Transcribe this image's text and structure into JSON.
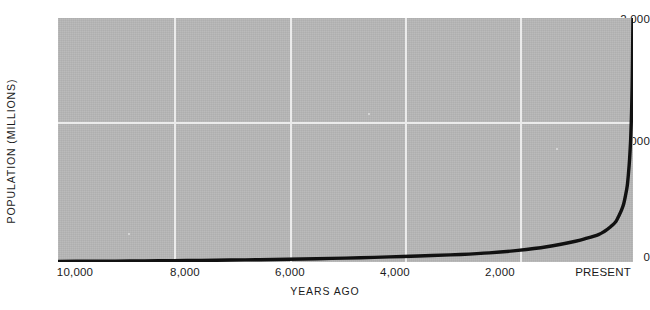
{
  "chart_data": {
    "type": "line",
    "title": "",
    "xlabel": "YEARS AGO",
    "ylabel": "POPULATION  (MILLIONS)",
    "x_tick_labels": [
      "10,000",
      "8,000",
      "6,000",
      "4,000",
      "2,000",
      "PRESENT"
    ],
    "x_tick_values": [
      10000,
      8000,
      6000,
      4000,
      2000,
      0
    ],
    "y_tick_labels": [
      "2,000",
      "1,000",
      "0"
    ],
    "y_tick_values": [
      2000,
      1000,
      0
    ],
    "xlim": [
      10000,
      0
    ],
    "ylim": [
      0,
      2000
    ],
    "x_axis_direction": "reversed",
    "grid": true,
    "gridline_color": "#ebebeb",
    "plot_background_color": "#b6b6b6",
    "curve_color": "#111111",
    "legend": null,
    "series": [
      {
        "name": "World population",
        "x": [
          10000,
          9500,
          9000,
          8500,
          8000,
          7500,
          7000,
          6500,
          6000,
          5500,
          5000,
          4500,
          4000,
          3500,
          3000,
          2500,
          2000,
          1500,
          1000,
          800,
          600,
          500,
          400,
          300,
          250,
          200,
          160,
          130,
          100,
          80,
          60,
          40,
          25,
          15,
          8,
          4,
          0
        ],
        "y": [
          5,
          6,
          7,
          9,
          11,
          13,
          16,
          19,
          23,
          27,
          32,
          38,
          45,
          53,
          62,
          75,
          95,
          125,
          170,
          195,
          225,
          250,
          285,
          330,
          375,
          425,
          480,
          545,
          625,
          720,
          840,
          1010,
          1220,
          1440,
          1680,
          1860,
          2000
        ]
      }
    ]
  },
  "axes": {
    "y_ticks": [
      {
        "label": "2,000",
        "top": 13
      },
      {
        "label": "1,000",
        "top": 135
      },
      {
        "label": "0",
        "top": 251
      }
    ],
    "x_ticks": [
      {
        "label": "10,000",
        "left": 30
      },
      {
        "label": "8,000",
        "left": 140
      },
      {
        "label": "6,000",
        "left": 245
      },
      {
        "label": "4,000",
        "left": 350
      },
      {
        "label": "2,000",
        "left": 455
      },
      {
        "label": "PRESENT",
        "left": 558
      }
    ],
    "gridlines_v": [
      174,
      290,
      405,
      520
    ],
    "gridlines_h": [
      122
    ]
  }
}
